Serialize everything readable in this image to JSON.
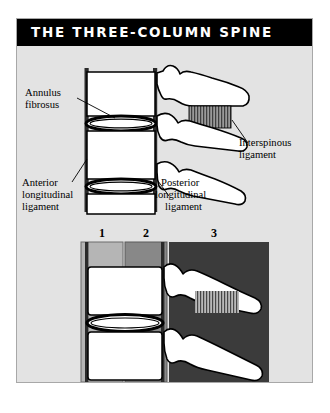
{
  "figure": {
    "title": "THE THREE-COLUMN SPINE",
    "background_color": "#e3e3e3",
    "banner_color": "#000000",
    "banner_text_color": "#ffffff",
    "page_color": "#ffffff",
    "border_color": "#a8a8a8"
  },
  "upper_diagram": {
    "name": "lateral-spine-anatomy",
    "labels": {
      "annulus_fibrosus": {
        "line1": "Annulus",
        "line2": "fibrosus"
      },
      "anterior_longitudinal_ligament": {
        "line1": "Anterior",
        "line2": "longitudinal",
        "line3": "ligament"
      },
      "posterior_longitudinal_ligament": {
        "line1": "Posterior",
        "line2": "longitudinal",
        "line3": "ligament"
      },
      "interspinous_ligament": {
        "line1": "Interspinous",
        "line2": "ligament"
      }
    },
    "structures": {
      "vertebral_body_fill": "#ffffff",
      "ligament_bar_color": "#2a2a2a",
      "disc_outline_color": "#000000",
      "interspinous_hatch_color": "#8e8e8e"
    }
  },
  "lower_diagram": {
    "name": "three-column-model",
    "columns": [
      {
        "number": "1",
        "label": "anterior-column",
        "color": "#b5b5b5"
      },
      {
        "number": "2",
        "label": "middle-column",
        "color": "#888888"
      },
      {
        "number": "3",
        "label": "posterior-column",
        "color": "#3b3b3b"
      }
    ],
    "structures": {
      "vertebral_body_fill": "#ffffff",
      "ligament_bar_color": "#2a2a2a",
      "disc_outline_color": "#000000"
    }
  }
}
